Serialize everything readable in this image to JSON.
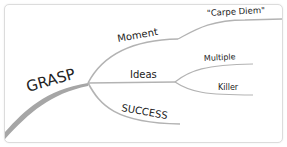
{
  "diagram": {
    "type": "mind-map",
    "colors": {
      "branch": "#b3b3b3",
      "trunk": "#999999",
      "text": "#222222",
      "border": "#dcdcdc",
      "background": "#ffffff"
    },
    "root": {
      "label": "GRASP",
      "children": [
        {
          "label": "Moment",
          "children": [
            {
              "label": "\"Carpe Diem\""
            }
          ]
        },
        {
          "label": "Ideas",
          "children": [
            {
              "label": "Multiple"
            },
            {
              "label": "Killer"
            }
          ]
        },
        {
          "label": "SUCCESS",
          "children": []
        }
      ]
    }
  }
}
